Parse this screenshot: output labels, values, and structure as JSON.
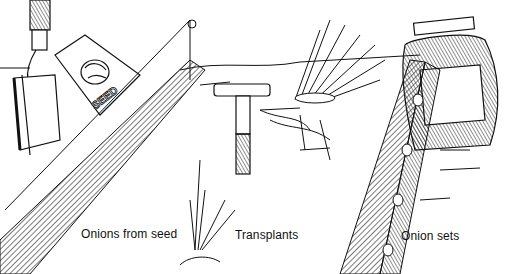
{
  "illustration": {
    "title": "Onion planting methods",
    "style": "black and white pen-and-ink line drawing",
    "colors": {
      "ink": "#111111",
      "paper": "#ffffff",
      "hatch": "#333333"
    },
    "panels": [
      {
        "id": "seed",
        "caption": "Onions from seed",
        "objects": [
          "hoe",
          "seed-packet",
          "seed-drill-furrow",
          "garden-line-string",
          "stake"
        ],
        "packet_label": "SEED"
      },
      {
        "id": "transplants",
        "caption": "Transplants",
        "objects": [
          "dibber",
          "bundle-of-onion-seedlings",
          "transplanted-seedlings"
        ]
      },
      {
        "id": "sets",
        "caption": "Onion sets",
        "objects": [
          "bag-of-onion-sets",
          "furrow-with-sets"
        ]
      }
    ]
  }
}
